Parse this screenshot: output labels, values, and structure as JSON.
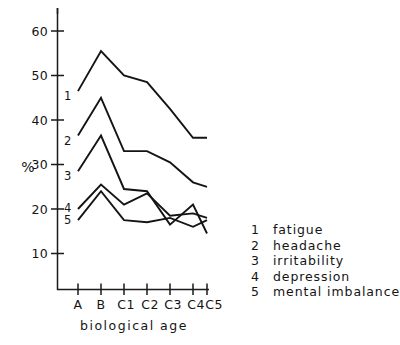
{
  "chart_data": {
    "type": "line",
    "title": "",
    "xlabel": "biological age",
    "ylabel": "%",
    "categories": [
      "A",
      "B",
      "C1",
      "C2",
      "C3",
      "C4",
      "C5"
    ],
    "ylim": [
      0,
      65
    ],
    "xlim_categories": 7,
    "yticks": [
      10,
      20,
      30,
      40,
      50,
      60
    ],
    "ytick_labels": [
      "10",
      "20",
      "30",
      "40",
      "50",
      "60"
    ],
    "grid": false,
    "legend_position": "right",
    "series": [
      {
        "name": "fatigue",
        "key": "1",
        "values": [
          46.5,
          55.5,
          50.0,
          48.5,
          42.5,
          36.0,
          36.0
        ]
      },
      {
        "name": "headache",
        "key": "2",
        "values": [
          36.5,
          45.0,
          33.0,
          33.0,
          30.5,
          26.0,
          25.0
        ]
      },
      {
        "name": "irritability",
        "key": "3",
        "values": [
          28.5,
          36.5,
          24.5,
          24.0,
          16.5,
          21.0,
          14.5
        ]
      },
      {
        "name": "depression",
        "key": "4",
        "values": [
          20.0,
          25.5,
          21.0,
          23.5,
          18.5,
          19.0,
          18.0
        ]
      },
      {
        "name": "mental imbalance",
        "key": "5",
        "values": [
          17.5,
          24.0,
          17.5,
          17.0,
          18.0,
          16.0,
          17.5
        ]
      }
    ],
    "inline_series_labels": [
      "1",
      "2",
      "3",
      "4",
      "5"
    ]
  },
  "axes": {
    "y_unit_label": "%",
    "x_axis_title": "biological age"
  },
  "legend": {
    "entries": [
      {
        "key": "1",
        "label": "fatigue"
      },
      {
        "key": "2",
        "label": "headache"
      },
      {
        "key": "3",
        "label": "irritability"
      },
      {
        "key": "4",
        "label": "depression"
      },
      {
        "key": "5",
        "label": "mental imbalance"
      }
    ]
  }
}
